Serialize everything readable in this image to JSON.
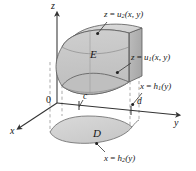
{
  "figure": {
    "kind": "3d-coordinate-diagram",
    "background_color": "#ffffff",
    "stroke_color": "#333333",
    "dash_color": "#9a9a9a",
    "solid_fill": "#c9c9c9",
    "solid_fill_light": "#d8d8d8",
    "solid_fill_dark": "#b4b4b4",
    "region_fill": "#d2d2d2"
  },
  "axes": {
    "z_label": "z",
    "y_label": "y",
    "x_label": "x",
    "origin_label": "0"
  },
  "ticks": {
    "c": "c",
    "d": "d"
  },
  "regions": {
    "solid_label": "E",
    "plane_label": "D"
  },
  "surface_labels": {
    "top": {
      "lhs": "z",
      "eq": " = ",
      "fn": "u",
      "sub": "2",
      "args": "(x, y)"
    },
    "bottom": {
      "lhs": "z",
      "eq": " = ",
      "fn": "u",
      "sub": "1",
      "args": "(x, y)"
    },
    "side_front": {
      "lhs": "x",
      "eq": " = ",
      "fn": "h",
      "sub": "1",
      "args": "(y)"
    },
    "side_back": {
      "lhs": "x",
      "eq": " = ",
      "fn": "h",
      "sub": "2",
      "args": "(y)"
    }
  }
}
